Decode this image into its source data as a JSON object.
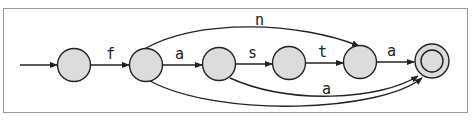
{
  "diagram": {
    "type": "finite-state-automaton",
    "colors": {
      "node_fill": "#dcdcdc",
      "stroke": "#222222",
      "frame": "#9a9a9a"
    },
    "nodes": [
      {
        "id": "q0",
        "initial": true,
        "accepting": false
      },
      {
        "id": "q1",
        "initial": false,
        "accepting": false
      },
      {
        "id": "q2",
        "initial": false,
        "accepting": false
      },
      {
        "id": "q3",
        "initial": false,
        "accepting": false
      },
      {
        "id": "q4",
        "initial": false,
        "accepting": false
      },
      {
        "id": "q5",
        "initial": false,
        "accepting": true
      }
    ],
    "edges": [
      {
        "from": "q0",
        "to": "q1",
        "label": "f"
      },
      {
        "from": "q1",
        "to": "q2",
        "label": "a"
      },
      {
        "from": "q2",
        "to": "q3",
        "label": "s"
      },
      {
        "from": "q3",
        "to": "q4",
        "label": "t"
      },
      {
        "from": "q4",
        "to": "q5",
        "label": "a"
      },
      {
        "from": "q1",
        "to": "q4",
        "label": "n"
      },
      {
        "from": "q2",
        "to": "q5",
        "label": "a"
      },
      {
        "from": "q1",
        "to": "q5",
        "label": ""
      }
    ],
    "labels": {
      "f": "f",
      "a1": "a",
      "s": "s",
      "t": "t",
      "a2": "a",
      "n": "n",
      "a3": "a"
    }
  }
}
